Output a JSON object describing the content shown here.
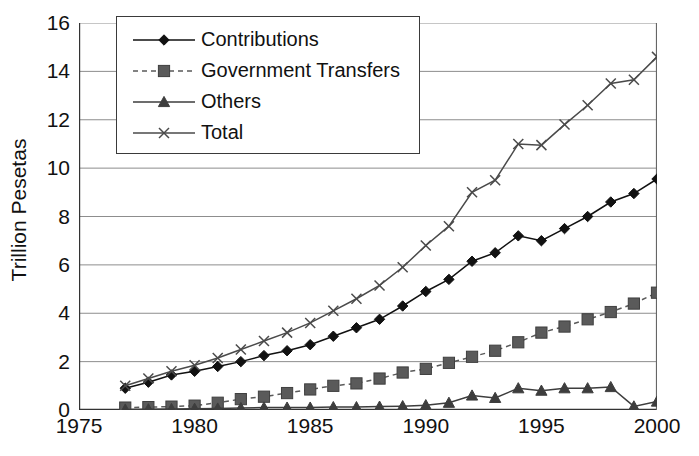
{
  "chart_data": {
    "type": "line",
    "title": "",
    "xlabel": "",
    "ylabel": "Trillion Pesetas",
    "xlim": [
      1975,
      2000
    ],
    "ylim": [
      0,
      16
    ],
    "ytick_labels": [
      "0",
      "2",
      "4",
      "6",
      "8",
      "10",
      "12",
      "14",
      "16"
    ],
    "yticks": [
      0,
      2,
      4,
      6,
      8,
      10,
      12,
      14,
      16
    ],
    "xtick_labels": [
      "1975",
      "1980",
      "1985",
      "1990",
      "1995",
      "2000"
    ],
    "xticks": [
      1975,
      1980,
      1985,
      1990,
      1995,
      2000
    ],
    "grid": "horizontal",
    "legend_position": "top-left-inside",
    "x": [
      1977,
      1978,
      1979,
      1980,
      1981,
      1982,
      1983,
      1984,
      1985,
      1986,
      1987,
      1988,
      1989,
      1990,
      1991,
      1992,
      1993,
      1994,
      1995,
      1996,
      1997,
      1998,
      1999,
      2000
    ],
    "series": [
      {
        "name": "Contributions",
        "marker": "diamond",
        "line": "solid",
        "color": "#111111",
        "values": [
          0.9,
          1.15,
          1.45,
          1.6,
          1.8,
          2.0,
          2.25,
          2.45,
          2.7,
          3.05,
          3.4,
          3.75,
          4.3,
          4.9,
          5.4,
          6.15,
          6.5,
          7.2,
          7.0,
          7.5,
          8.0,
          8.6,
          8.95,
          9.55
        ]
      },
      {
        "name": "Government Transfers",
        "marker": "square",
        "line": "dashed",
        "color": "#5a5a5a",
        "values": [
          0.1,
          0.12,
          0.14,
          0.18,
          0.3,
          0.45,
          0.55,
          0.7,
          0.85,
          1.0,
          1.1,
          1.3,
          1.55,
          1.7,
          1.95,
          2.2,
          2.45,
          2.8,
          3.2,
          3.45,
          3.75,
          4.05,
          4.4,
          4.85
        ]
      },
      {
        "name": "Others",
        "marker": "triangle",
        "line": "solid",
        "color": "#3d3d3d",
        "values": [
          0.02,
          0.03,
          0.04,
          0.05,
          0.06,
          0.08,
          0.1,
          0.1,
          0.1,
          0.12,
          0.12,
          0.14,
          0.16,
          0.2,
          0.3,
          0.6,
          0.5,
          0.9,
          0.8,
          0.9,
          0.9,
          0.95,
          0.15,
          0.35
        ]
      },
      {
        "name": "Total",
        "marker": "x",
        "line": "solid",
        "color": "#4a4a4a",
        "values": [
          1.0,
          1.3,
          1.6,
          1.85,
          2.15,
          2.5,
          2.85,
          3.2,
          3.6,
          4.1,
          4.6,
          5.15,
          5.9,
          6.8,
          7.6,
          9.0,
          9.5,
          11.0,
          10.95,
          11.8,
          12.6,
          13.5,
          13.65,
          14.6
        ]
      }
    ]
  },
  "legend": {
    "items": [
      {
        "label": "Contributions"
      },
      {
        "label": "Government Transfers"
      },
      {
        "label": "Others"
      },
      {
        "label": "Total"
      }
    ]
  }
}
